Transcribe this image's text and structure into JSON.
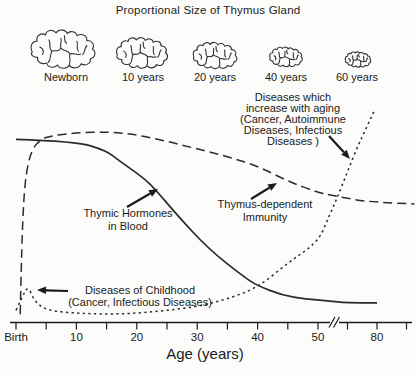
{
  "title": "Proportional Size of Thymus Gland",
  "thymus_row": {
    "items": [
      {
        "label": "Newborn"
      },
      {
        "label": "10 years"
      },
      {
        "label": "20 years"
      },
      {
        "label": "40 years"
      },
      {
        "label": "60 years"
      }
    ]
  },
  "colors": {
    "ink": "#1b1b1b",
    "curve": "#2b2b2b",
    "background": "#fcfcfa"
  },
  "chart_data": {
    "type": "line",
    "title": "Proportional Size of Thymus Gland",
    "xlabel": "Age (years)",
    "ylabel": "",
    "y_axis": {
      "visible": false,
      "scale": "relative level 0-110 (unlabeled in figure)"
    },
    "x_axis": {
      "tick_labels": [
        "Birth",
        "10",
        "20",
        "30",
        "40",
        "50",
        "80"
      ],
      "tick_ages": [
        0,
        10,
        20,
        30,
        40,
        50,
        80
      ],
      "minor_tick_ages": [
        5,
        15,
        25,
        35,
        45,
        65,
        95
      ],
      "axis_break_after_age": 50
    },
    "series": [
      {
        "name": "Thymic Hormones in Blood",
        "style": "solid",
        "points": [
          [
            0,
            94
          ],
          [
            10,
            93
          ],
          [
            15,
            88
          ],
          [
            17,
            83
          ],
          [
            21,
            74
          ],
          [
            23,
            68
          ],
          [
            27,
            53
          ],
          [
            32,
            36
          ],
          [
            38,
            21
          ],
          [
            40,
            17
          ],
          [
            44,
            12
          ],
          [
            48,
            10
          ],
          [
            55,
            9
          ],
          [
            65,
            8
          ],
          [
            80,
            8
          ]
        ]
      },
      {
        "name": "Thymus-dependent Immunity",
        "style": "dashed",
        "points": [
          [
            0.7,
            2
          ],
          [
            0.9,
            30
          ],
          [
            1.2,
            58
          ],
          [
            1.6,
            75
          ],
          [
            2.5,
            88
          ],
          [
            4,
            94
          ],
          [
            6,
            96
          ],
          [
            10,
            97.5
          ],
          [
            15,
            98
          ],
          [
            20,
            96.5
          ],
          [
            25,
            93
          ],
          [
            30,
            89
          ],
          [
            35,
            85
          ],
          [
            40,
            80
          ],
          [
            45,
            72
          ],
          [
            50,
            66
          ],
          [
            60,
            64
          ],
          [
            70,
            62
          ],
          [
            80,
            61
          ],
          [
            99,
            60
          ]
        ]
      },
      {
        "name": "Diseases incidence (childhood peak, rising with aging)",
        "style": "dotted",
        "points": [
          [
            0,
            4
          ],
          [
            1,
            11
          ],
          [
            2,
            17
          ],
          [
            3,
            9
          ],
          [
            5,
            4
          ],
          [
            10,
            2.5
          ],
          [
            15,
            2
          ],
          [
            20,
            2.5
          ],
          [
            25,
            4
          ],
          [
            30,
            6
          ],
          [
            35,
            10
          ],
          [
            40,
            16
          ],
          [
            45,
            29
          ],
          [
            50,
            40
          ],
          [
            55,
            52
          ],
          [
            60,
            64
          ],
          [
            65,
            77
          ],
          [
            70,
            90
          ],
          [
            75,
            101
          ],
          [
            79,
            110
          ]
        ]
      }
    ],
    "annotations": [
      {
        "id": "diseases-aging",
        "lines": [
          "Diseases which",
          "increase with aging",
          "(Cancer, Autoimmune",
          "Diseases, Infectious",
          "Diseases )"
        ],
        "x": 293,
        "y": 101,
        "line_h": 11,
        "arrow": [
          329,
          136,
          350,
          159
        ]
      },
      {
        "id": "thymic-hormones",
        "lines": [
          "Thymic Hormones",
          "in Blood"
        ],
        "x": 128,
        "y": 217,
        "line_h": 13,
        "arrow": [
          127,
          207,
          158,
          189
        ]
      },
      {
        "id": "thymus-immunity",
        "lines": [
          "Thymus-dependent",
          "Immunity"
        ],
        "x": 265,
        "y": 208,
        "line_h": 13,
        "arrow": [
          251,
          199,
          277,
          183
        ]
      },
      {
        "id": "diseases-childhood",
        "lines": [
          "Diseases of Childhood",
          "(Cancer, Infectious Diseases)"
        ],
        "x": 140,
        "y": 294,
        "line_h": 12,
        "arrow": [
          68,
          291,
          37,
          290
        ]
      }
    ],
    "legend_position": "none",
    "grid": false
  }
}
